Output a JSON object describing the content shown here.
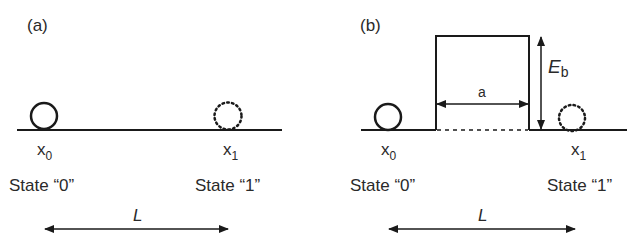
{
  "colors": {
    "line": "#1a1a1a",
    "text": "#2a2a2a",
    "background": "#ffffff"
  },
  "panels": [
    {
      "id": "a",
      "label": "(a)",
      "positions": [
        {
          "symbol": "x",
          "subscript": "0",
          "state_label": "State “0”",
          "ball": "solid"
        },
        {
          "symbol": "x",
          "subscript": "1",
          "state_label": "State “1”",
          "ball": "dotted"
        }
      ],
      "distance_label": "L",
      "barrier": null
    },
    {
      "id": "b",
      "label": "(b)",
      "positions": [
        {
          "symbol": "x",
          "subscript": "0",
          "state_label": "State “0”",
          "ball": "solid"
        },
        {
          "symbol": "x",
          "subscript": "1",
          "state_label": "State “1”",
          "ball": "dotted"
        }
      ],
      "distance_label": "L",
      "barrier": {
        "width_label": "a",
        "height_label": "E",
        "height_label_subscript": "b"
      }
    }
  ]
}
